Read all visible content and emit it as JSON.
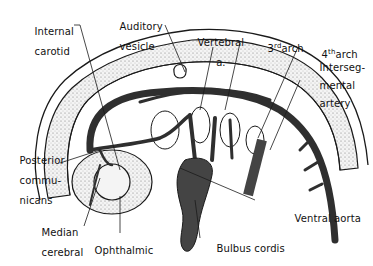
{
  "diagram": {
    "colors": {
      "outline": "#1a1a1a",
      "vessel_fill": "#3a3a3a",
      "stipple": "#d8d8d8",
      "background": "#ffffff"
    },
    "labels": {
      "internal_carotid_1": "Internal",
      "internal_carotid_2": "carotid",
      "auditory_vesicle_1": "Auditory",
      "auditory_vesicle_2": "vesicle",
      "vertebral_1": "Vertebral",
      "vertebral_2": "a.",
      "arch3_num": "3",
      "arch3_sup": "rd",
      "arch3_word": "arch",
      "arch4_num": "4",
      "arch4_sup": "th",
      "arch4_word": "arch",
      "intersegmental_1": "Interseg-",
      "intersegmental_2": "mental",
      "intersegmental_3": "artery",
      "posterior_communicans_1": "Posterior",
      "posterior_communicans_2": "commu-",
      "posterior_communicans_3": "nicans",
      "median_cerebral_1": "Median",
      "median_cerebral_2": "cerebral",
      "ophthalmic": "Ophthalmic",
      "bulbus_cordis": "Bulbus cordis",
      "ventral_aorta": "Ventral aorta"
    }
  }
}
